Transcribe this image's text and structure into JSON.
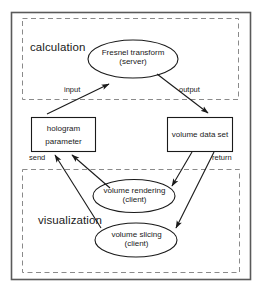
{
  "diagram": {
    "zones": [
      {
        "id": "calculation",
        "label": "calculation"
      },
      {
        "id": "visualization",
        "label": "visualization"
      }
    ],
    "nodes": [
      {
        "id": "fresnel-transform",
        "shape": "ellipse",
        "line1": "Fresnel transform",
        "line2": "(server)"
      },
      {
        "id": "hologram-parameter",
        "shape": "rectangle",
        "line1": "hologram",
        "line2": "parameter"
      },
      {
        "id": "volume-data-set",
        "shape": "rectangle",
        "line1": "volume data set",
        "line2": ""
      },
      {
        "id": "volume-rendering",
        "shape": "ellipse",
        "line1": "volume rendering",
        "line2": "(client)"
      },
      {
        "id": "volume-slicing",
        "shape": "ellipse",
        "line1": "volume slicing",
        "line2": "(client)"
      }
    ],
    "edges": [
      {
        "id": "input",
        "label": "input",
        "from": "hologram-parameter",
        "to": "fresnel-transform"
      },
      {
        "id": "output",
        "label": "output",
        "from": "fresnel-transform",
        "to": "volume-data-set"
      },
      {
        "id": "send",
        "label": "send",
        "from": "visualization-clients",
        "to": "hologram-parameter"
      },
      {
        "id": "return",
        "label": "return",
        "from": "volume-data-set",
        "to": "volume-slicing"
      },
      {
        "id": "data-to-rendering",
        "label": "",
        "from": "volume-data-set",
        "to": "volume-rendering"
      },
      {
        "id": "rendering-to-hologram",
        "label": "",
        "from": "volume-rendering",
        "to": "hologram-parameter"
      },
      {
        "id": "slicing-to-hologram",
        "label": "",
        "from": "volume-slicing",
        "to": "hologram-parameter"
      }
    ],
    "colors": {
      "stroke": "#1a1a1a",
      "zone_border": "#8a8a8a",
      "frame": "#5a5a5a",
      "background": "#ffffff"
    }
  }
}
